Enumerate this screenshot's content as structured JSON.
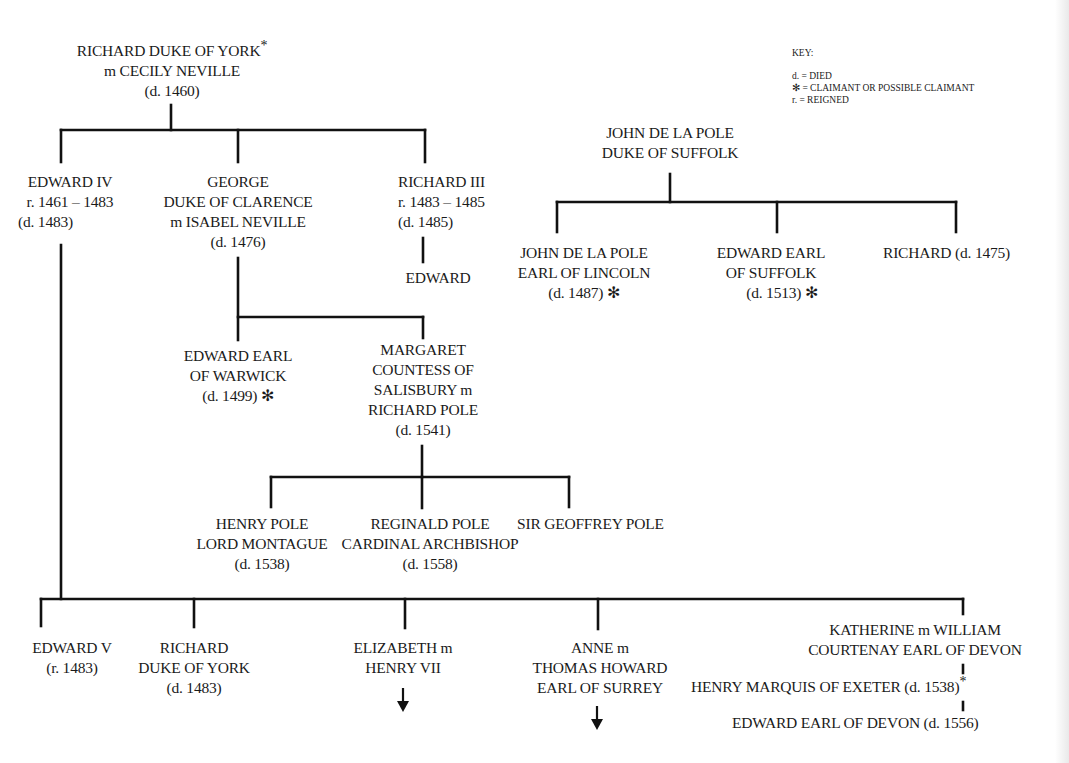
{
  "key": {
    "title": "KEY:",
    "items": [
      "d. = DIED",
      "✻ = CLAIMANT OR POSSIBLE CLAIMANT",
      "r. = REIGNED"
    ]
  },
  "colors": {
    "line": "#111111",
    "text": "#1a1a1a",
    "background": "#ffffff"
  },
  "tree": {
    "richard_york": [
      "RICHARD DUKE OF YORK",
      "m CECILY NEVILLE",
      "(d. 1460)"
    ],
    "richard_york_star": "*",
    "edward_iv": [
      "EDWARD IV",
      "r. 1461 – 1483",
      "(d. 1483)"
    ],
    "george": [
      "GEORGE",
      "DUKE OF CLARENCE",
      "m  ISABEL NEVILLE",
      "(d. 1476)"
    ],
    "richard_iii": [
      "RICHARD III",
      "r. 1483 – 1485",
      "(d. 1485)"
    ],
    "edward_son_r3": "EDWARD",
    "edward_warwick": [
      "EDWARD EARL",
      "OF WARWICK",
      "(d. 1499) ✻"
    ],
    "margaret": [
      "MARGARET",
      "COUNTESS OF",
      "SALISBURY m",
      "RICHARD POLE",
      "(d. 1541)"
    ],
    "henry_pole": [
      "HENRY POLE",
      "LORD MONTAGUE",
      "(d. 1538)"
    ],
    "reginald_pole": [
      "REGINALD POLE",
      "CARDINAL ARCHBISHOP",
      "(d. 1558)"
    ],
    "geoffrey_pole": "SIR GEOFFREY POLE",
    "john_suffolk": [
      "JOHN DE LA POLE",
      "DUKE OF SUFFOLK"
    ],
    "john_lincoln": [
      "JOHN DE LA POLE",
      "EARL OF LINCOLN",
      "(d. 1487) ✻"
    ],
    "edward_suffolk": [
      "EDWARD EARL",
      "OF SUFFOLK",
      "(d. 1513) ✻"
    ],
    "richard_suffolk": "RICHARD (d. 1475)",
    "edward_v": [
      "EDWARD V",
      "(r. 1483)"
    ],
    "richard_york_jr": [
      "RICHARD",
      "DUKE OF YORK",
      "(d. 1483)"
    ],
    "elizabeth": [
      "ELIZABETH m",
      "HENRY VII"
    ],
    "anne": [
      "ANNE m",
      "THOMAS HOWARD",
      "EARL OF SURREY"
    ],
    "katherine": [
      "KATHERINE m WILLIAM",
      "COURTENAY EARL OF DEVON"
    ],
    "henry_exeter": "HENRY MARQUIS OF EXETER (d. 1538)",
    "henry_exeter_star": "*",
    "edward_devon": "EDWARD EARL OF DEVON (d. 1556)",
    "arrow_glyph": "↓"
  }
}
